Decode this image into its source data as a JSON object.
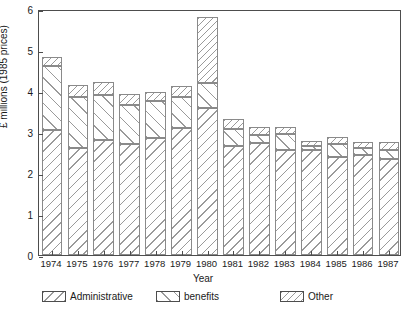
{
  "chart_data": {
    "type": "bar",
    "title": "",
    "subtitle": "",
    "xlabel": "Year",
    "ylabel": "£ millions (1985 prices)",
    "ylim": [
      0,
      6
    ],
    "yticks": [
      0,
      1,
      2,
      3,
      4,
      5,
      6
    ],
    "ytick_labels": [
      "0",
      "1",
      "2",
      "3",
      "4",
      "5",
      "6"
    ],
    "grid": false,
    "stacked": true,
    "legend_position": "bottom",
    "categories": [
      "1974",
      "1975",
      "1976",
      "1977",
      "1978",
      "1979",
      "1980",
      "1981",
      "1982",
      "1983",
      "1984",
      "1985",
      "1986",
      "1987"
    ],
    "series": [
      {
        "name": "Administrative",
        "fill": "hatch-forward",
        "values": [
          3.05,
          2.6,
          2.8,
          2.7,
          2.85,
          3.1,
          3.58,
          2.65,
          2.72,
          2.57,
          2.55,
          2.4,
          2.45,
          2.35
        ]
      },
      {
        "name": "benefits",
        "fill": "hatch-back",
        "values": [
          1.55,
          1.25,
          1.1,
          0.95,
          0.9,
          0.75,
          0.62,
          0.42,
          0.2,
          0.38,
          0.12,
          0.3,
          0.15,
          0.22
        ]
      },
      {
        "name": "Other",
        "fill": "hatch-dense",
        "values": [
          0.22,
          0.3,
          0.33,
          0.27,
          0.22,
          0.28,
          1.6,
          0.25,
          0.2,
          0.18,
          0.12,
          0.18,
          0.15,
          0.18
        ]
      }
    ],
    "totals": [
      4.82,
      4.15,
      4.23,
      3.92,
      3.97,
      4.13,
      5.8,
      3.32,
      3.12,
      3.13,
      2.79,
      2.88,
      2.75,
      2.75
    ]
  },
  "legend": {
    "items": [
      {
        "label": "Administrative",
        "key": "hatch-forward"
      },
      {
        "label": "benefits",
        "key": "hatch-back"
      },
      {
        "label": "Other",
        "key": "hatch-dense"
      }
    ]
  },
  "colors": {
    "axis": "#4d4d4d",
    "bar_edge": "#8a8a8a",
    "hatch": "#9a9a9a",
    "background": "#ffffff",
    "text": "#1a1a1a"
  }
}
